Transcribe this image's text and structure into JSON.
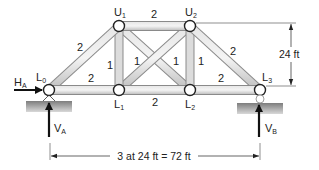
{
  "diagram": {
    "type": "truss",
    "nodes": [
      {
        "id": "L0",
        "label": "L",
        "sub": "0",
        "x": 49,
        "y": 90
      },
      {
        "id": "L1",
        "label": "L",
        "sub": "1",
        "x": 119,
        "y": 90
      },
      {
        "id": "L2",
        "label": "L",
        "sub": "2",
        "x": 190,
        "y": 90
      },
      {
        "id": "L3",
        "label": "L",
        "sub": "3",
        "x": 260,
        "y": 90
      },
      {
        "id": "U1",
        "label": "U",
        "sub": "1",
        "x": 119,
        "y": 26
      },
      {
        "id": "U2",
        "label": "U",
        "sub": "2",
        "x": 190,
        "y": 26
      }
    ],
    "members": [
      {
        "from": "L0",
        "to": "U1",
        "area": "2"
      },
      {
        "from": "U1",
        "to": "U2",
        "area": "2"
      },
      {
        "from": "U2",
        "to": "L3",
        "area": "2"
      },
      {
        "from": "L0",
        "to": "L1",
        "area": "2"
      },
      {
        "from": "L1",
        "to": "L2",
        "area": "2"
      },
      {
        "from": "L2",
        "to": "L3",
        "area": "2"
      },
      {
        "from": "U1",
        "to": "L1",
        "area": "1"
      },
      {
        "from": "U2",
        "to": "L2",
        "area": "1"
      },
      {
        "from": "U1",
        "to": "L2",
        "area": "1"
      },
      {
        "from": "L1",
        "to": "U2",
        "area": "1"
      }
    ],
    "member_labels": {
      "L0U1": "2",
      "U1U2": "2",
      "U2L3": "2",
      "L0L1": "2",
      "L1L2": "2",
      "L2L3": "2",
      "U1L1": "1",
      "L1U2": "1",
      "U1L2": "1",
      "U2L2": "1"
    },
    "reactions": {
      "HA": {
        "label": "H",
        "sub": "A"
      },
      "VA": {
        "label": "V",
        "sub": "A"
      },
      "VB": {
        "label": "V",
        "sub": "B"
      }
    },
    "dimensions": {
      "height": "24 ft",
      "span": "3 at 24 ft = 72 ft"
    },
    "colors": {
      "member_fill": "#d4d4d4",
      "member_edge": "#8a8a8a",
      "support": "#9a9a9a",
      "arrow": "#111111",
      "text": "#222222"
    }
  }
}
